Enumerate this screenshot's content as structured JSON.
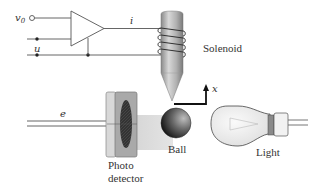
{
  "diagram": {
    "type": "magnetic-levitation-system",
    "labels": {
      "input_voltage": "v",
      "input_voltage_sub": "0",
      "control_input": "u",
      "current": "i",
      "solenoid": "Solenoid",
      "position_axis": "x",
      "error_signal": "e",
      "photo_detector_line1": "Photo",
      "photo_detector_line2": "detector",
      "ball": "Ball",
      "light": "Light"
    },
    "components": [
      {
        "name": "amplifier",
        "shape": "triangle"
      },
      {
        "name": "solenoid",
        "shape": "coil-on-cone"
      },
      {
        "name": "ball",
        "shape": "sphere"
      },
      {
        "name": "photo-detector",
        "shape": "box-with-lens"
      },
      {
        "name": "light-bulb",
        "shape": "bulb"
      }
    ],
    "colors": {
      "line": "#555555",
      "solenoid_core": "#a8a8a8",
      "ball_dark": "#1a1a1a",
      "beam": "#d9d9d9",
      "detector_frame": "#c8c8c8",
      "detector_lens": "#3a3a3a",
      "bulb_glass": "#eeeeee"
    }
  }
}
